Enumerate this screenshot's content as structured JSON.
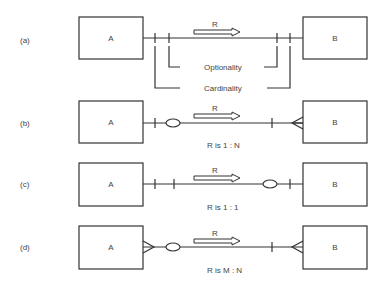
{
  "diagrams": [
    {
      "label": "(a)",
      "entity_left": "A",
      "entity_right": "B",
      "relationship": "R",
      "caption": "",
      "annotations": [
        "Optionality",
        "Cardinality"
      ]
    },
    {
      "label": "(b)",
      "entity_left": "A",
      "entity_right": "B",
      "relationship": "R",
      "caption": "R is 1 : N"
    },
    {
      "label": "(c)",
      "entity_left": "A",
      "entity_right": "B",
      "relationship": "R",
      "caption": "R is 1 : 1"
    },
    {
      "label": "(d)",
      "entity_left": "A",
      "entity_right": "B",
      "relationship": "R",
      "caption": "R is M : N"
    }
  ],
  "colors": {
    "stroke": "#333333",
    "background": "#ffffff"
  }
}
